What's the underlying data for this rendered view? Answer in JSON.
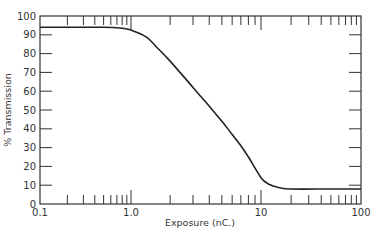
{
  "chart_data": {
    "type": "line",
    "title": "",
    "xlabel": "Exposure (nC.)",
    "ylabel": "% Transmission",
    "xscale": "log",
    "xlim": [
      0.1,
      100
    ],
    "ylim": [
      0,
      100
    ],
    "grid": false,
    "legend": null,
    "x_tick_labels": [
      "0.1",
      "1.0",
      "10",
      "100"
    ],
    "y_tick_labels": [
      "0",
      "10",
      "20",
      "30",
      "40",
      "50",
      "60",
      "70",
      "80",
      "90",
      "100"
    ],
    "series": [
      {
        "name": "Transmission",
        "x": [
          0.1,
          0.5,
          0.8,
          1.0,
          1.3,
          1.6,
          2.0,
          3.0,
          4.0,
          5.0,
          6.0,
          7.0,
          8.0,
          10.0,
          12.0,
          15.0,
          20.0,
          50.0,
          100.0
        ],
        "y": [
          94,
          94,
          93.5,
          92.5,
          89,
          83,
          76,
          62,
          52,
          44,
          37,
          31,
          25,
          14,
          10.5,
          8.8,
          8,
          8,
          8
        ]
      }
    ]
  },
  "colors": {
    "line": "#222222",
    "axis": "#333333",
    "background": "#ffffff"
  }
}
